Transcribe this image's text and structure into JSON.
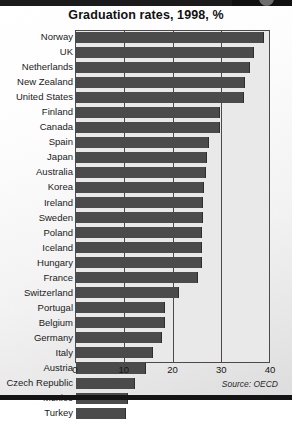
{
  "chart_data": {
    "type": "bar",
    "orientation": "horizontal",
    "title": "Graduation rates, 1998, %",
    "xlabel": "",
    "ylabel": "",
    "xlim": [
      0,
      40
    ],
    "xticks": [
      0,
      10,
      20,
      30,
      40
    ],
    "grid": true,
    "legend": false,
    "source": "Source: OECD",
    "bar_color": "#4b4b4b",
    "plot_background": "#e9e9e9",
    "categories": [
      "Norway",
      "UK",
      "Netherlands",
      "New Zealand",
      "United States",
      "Finland",
      "Canada",
      "Spain",
      "Japan",
      "Australia",
      "Korea",
      "Ireland",
      "Sweden",
      "Poland",
      "Iceland",
      "Hungary",
      "France",
      "Switzerland",
      "Portugal",
      "Belgium",
      "Germany",
      "Italy",
      "Austria",
      "Czech Republic",
      "Mexico",
      "Turkey"
    ],
    "values": [
      38.3,
      36.3,
      35.5,
      34.5,
      34.2,
      29.3,
      29.3,
      27.0,
      26.6,
      26.4,
      26.0,
      25.8,
      25.8,
      25.6,
      25.6,
      25.6,
      24.8,
      20.9,
      18.0,
      18.0,
      17.4,
      15.6,
      14.2,
      11.9,
      10.5,
      10.1
    ],
    "ticklabels": [
      "0",
      "10",
      "20",
      "30",
      "40"
    ]
  }
}
